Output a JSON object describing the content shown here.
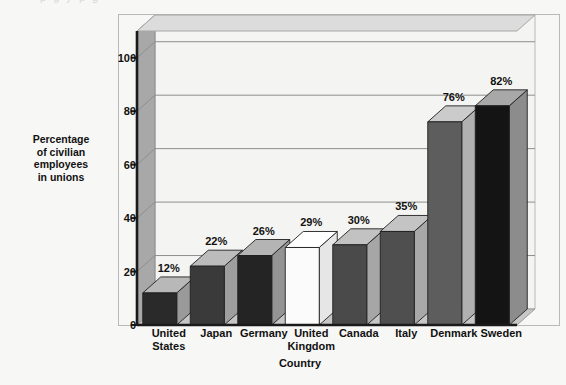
{
  "top_sliver_text": "p            g      y     p        g",
  "chart_data": {
    "type": "bar",
    "title": "",
    "xlabel": "Country",
    "ylabel": "Percentage of civilian employees in unions",
    "ylabel_lines": [
      "Percentage",
      "of civilian",
      "employees",
      "in unions"
    ],
    "categories": [
      "United States",
      "Japan",
      "Germany",
      "United Kingdom",
      "Canada",
      "Italy",
      "Denmark",
      "Sweden"
    ],
    "category_lines": [
      [
        "United",
        "States"
      ],
      [
        "Japan"
      ],
      [
        "Germany"
      ],
      [
        "United",
        "Kingdom"
      ],
      [
        "Canada"
      ],
      [
        "Italy"
      ],
      [
        "Denmark"
      ],
      [
        "Sweden"
      ]
    ],
    "values": [
      12,
      22,
      26,
      29,
      30,
      35,
      76,
      82
    ],
    "value_labels": [
      "12%",
      "22%",
      "26%",
      "29%",
      "30%",
      "35%",
      "76%",
      "82%"
    ],
    "unit": "%",
    "ylim": [
      0,
      110
    ],
    "yticks": [
      0,
      20,
      40,
      60,
      80,
      100
    ],
    "ytick_labels": [
      "0",
      "20",
      "40",
      "60",
      "80",
      "100"
    ],
    "grid": true,
    "legend": "none",
    "style": "3d-column",
    "bar_face_colors": [
      "#2a2a2a",
      "#3a3a3a",
      "#242424",
      "#fbfbfb",
      "#4a4a4a",
      "#4f4f4f",
      "#5d5d5d",
      "#141414"
    ],
    "bar_top_colors": [
      "#b8b8b8",
      "#bcbcbc",
      "#b4b4b4",
      "#ffffff",
      "#c2c2c2",
      "#c4c4c4",
      "#cbcbcb",
      "#a8a8a8"
    ],
    "bar_side_colors": [
      "#9a9a9a",
      "#9e9e9e",
      "#949494",
      "#e6e6e6",
      "#a6a6a6",
      "#a8a8a8",
      "#b0b0b0",
      "#8c8c8c"
    ]
  },
  "colors": {
    "background": "#f7f7f5",
    "plot_background": "#f4f4f2",
    "wall_left": "#a8a8a8",
    "floor": "#c6c6c6",
    "ceiling": "#dcdcdc",
    "gridline": "#8e8e8e",
    "axis": "#1a1a1a",
    "outer_border": "#b9b9b9",
    "text": "#111111"
  }
}
